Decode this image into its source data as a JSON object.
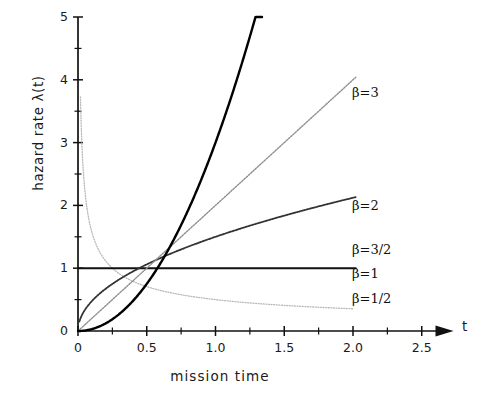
{
  "chart_data": {
    "type": "line",
    "title": "",
    "xlabel": "mission time",
    "ylabel": "hazard rate  λ(t)",
    "x_axis_name": "t",
    "xlim": [
      0,
      2.6
    ],
    "ylim": [
      0,
      5
    ],
    "xticks": [
      "0",
      "0.5",
      "1.0",
      "1.5",
      "2.0",
      "2.5"
    ],
    "xtick_values": [
      0,
      0.5,
      1.0,
      1.5,
      2.0,
      2.5
    ],
    "xminor_step": 0.25,
    "yticks": [
      "0",
      "1",
      "2",
      "3",
      "4",
      "5"
    ],
    "ytick_values": [
      0,
      1,
      2,
      3,
      4,
      5
    ],
    "yminor_step": 0.5,
    "grid": false,
    "legend_position": "right-inline",
    "formula": "λ(t) = β t^(β-1)",
    "series": [
      {
        "name": "β=1/2",
        "beta": 0.5,
        "label": "β=1/2",
        "label_x": 352,
        "label_y": 291,
        "color": "#b9b9b9",
        "width": 1.3,
        "dash": "1,1.6",
        "x_start": 0.018,
        "x_end": 2.0,
        "points": [
          [
            0.02,
            3.54
          ],
          [
            0.03,
            2.89
          ],
          [
            0.04,
            2.5
          ],
          [
            0.05,
            2.24
          ],
          [
            0.06,
            2.04
          ],
          [
            0.08,
            1.77
          ],
          [
            0.1,
            1.58
          ],
          [
            0.125,
            1.41
          ],
          [
            0.15,
            1.29
          ],
          [
            0.2,
            1.12
          ],
          [
            0.25,
            1.0
          ],
          [
            0.3,
            0.91
          ],
          [
            0.4,
            0.79
          ],
          [
            0.5,
            0.71
          ],
          [
            0.6,
            0.65
          ],
          [
            0.7,
            0.6
          ],
          [
            0.8,
            0.56
          ],
          [
            0.9,
            0.53
          ],
          [
            1.0,
            0.5
          ],
          [
            1.2,
            0.46
          ],
          [
            1.4,
            0.42
          ],
          [
            1.6,
            0.4
          ],
          [
            1.8,
            0.37
          ],
          [
            2.0,
            0.35
          ]
        ]
      },
      {
        "name": "β=1",
        "beta": 1,
        "label": "β=1",
        "label_x": 352,
        "label_y": 266,
        "color": "#111111",
        "width": 2.0,
        "dash": "",
        "x_start": 0.0,
        "x_end": 2.02,
        "points": [
          [
            0,
            1
          ],
          [
            2.02,
            1
          ]
        ]
      },
      {
        "name": "β=3/2",
        "beta": 1.5,
        "label": "β=3/2",
        "label_x": 352,
        "label_y": 242,
        "color": "#333333",
        "width": 1.8,
        "dash": "2.4,1.1",
        "x_start": 0.01,
        "x_end": 2.02,
        "points": [
          [
            0.01,
            0.15
          ],
          [
            0.02,
            0.21
          ],
          [
            0.04,
            0.3
          ],
          [
            0.06,
            0.37
          ],
          [
            0.09,
            0.45
          ],
          [
            0.12,
            0.52
          ],
          [
            0.16,
            0.6
          ],
          [
            0.2,
            0.67
          ],
          [
            0.25,
            0.75
          ],
          [
            0.3,
            0.82
          ],
          [
            0.4,
            0.95
          ],
          [
            0.5,
            1.06
          ],
          [
            0.6,
            1.16
          ],
          [
            0.7,
            1.26
          ],
          [
            0.8,
            1.34
          ],
          [
            0.9,
            1.42
          ],
          [
            1.0,
            1.5
          ],
          [
            1.2,
            1.64
          ],
          [
            1.4,
            1.78
          ],
          [
            1.6,
            1.9
          ],
          [
            1.8,
            2.01
          ],
          [
            2.0,
            2.12
          ]
        ]
      },
      {
        "name": "β=2",
        "beta": 2,
        "label": "β=2",
        "label_x": 352,
        "label_y": 198,
        "color": "#8f8f8f",
        "width": 1.4,
        "dash": "1.6,1.4",
        "x_start": 0.0,
        "x_end": 2.02,
        "points": [
          [
            0,
            0
          ],
          [
            2.02,
            4.04
          ]
        ]
      },
      {
        "name": "β=3",
        "beta": 3,
        "label": "β=3",
        "label_x": 352,
        "label_y": 85,
        "color": "#000000",
        "width": 2.4,
        "dash": "",
        "x_start": 0.0,
        "x_end": 2.0,
        "points": [
          [
            0,
            0
          ],
          [
            0.1,
            0.03
          ],
          [
            0.2,
            0.12
          ],
          [
            0.3,
            0.27
          ],
          [
            0.4,
            0.48
          ],
          [
            0.5,
            0.75
          ],
          [
            0.6,
            1.08
          ],
          [
            0.7,
            1.47
          ],
          [
            0.8,
            1.92
          ],
          [
            0.9,
            2.43
          ],
          [
            1.0,
            3.0
          ],
          [
            1.1,
            3.63
          ],
          [
            1.15,
            3.97
          ]
        ]
      }
    ]
  },
  "axes": {
    "y_axis_label": "hazard rate  λ(t)",
    "x_axis_label": "mission time",
    "x_axis_symbol": "t"
  }
}
